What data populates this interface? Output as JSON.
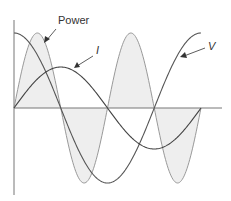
{
  "diagram": {
    "type": "ac-power-waveforms",
    "labels": {
      "power": "Power",
      "current": "I",
      "voltage": "V"
    },
    "colors": {
      "axis": "#777777",
      "voltage": "#555555",
      "current": "#444444",
      "power": "#999999",
      "power_fill": "#eeeeee",
      "text": "#333333"
    },
    "geometry": {
      "origin_x": 14,
      "zero_y": 108,
      "period_px": 187,
      "axis_top": 20,
      "axis_bottom": 195,
      "axis_right": 222,
      "voltage_amplitude": 75,
      "current_amplitude": 41,
      "power_amplitude": 75
    },
    "series": [
      {
        "name": "V",
        "shape": "cosine",
        "phase": "leads I by 90°"
      },
      {
        "name": "I",
        "shape": "sine",
        "phase": "0°"
      },
      {
        "name": "Power",
        "shape": "sine at 2× frequency",
        "note": "shaded area, alternates positive/negative — average power zero"
      }
    ]
  }
}
